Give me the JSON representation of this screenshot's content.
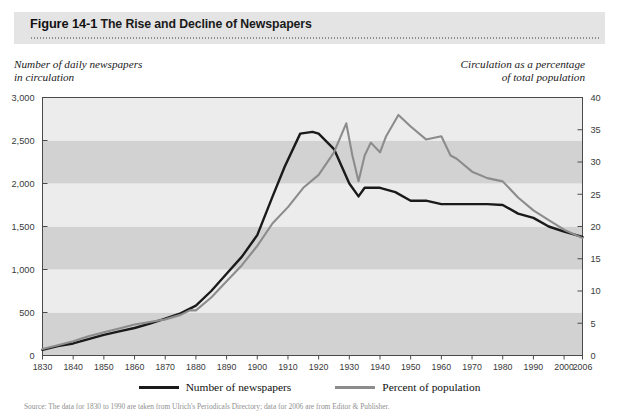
{
  "header": {
    "figure_number": "Figure 14-1",
    "figure_title": "The Rise and Decline of Newspapers"
  },
  "axis_captions": {
    "left_line1": "Number of daily newspapers",
    "left_line2": "in circulation",
    "right_line1": "Circulation as a percentage",
    "right_line2": "of total population"
  },
  "legend": {
    "series1_label": "Number of newspapers",
    "series2_label": "Percent of population",
    "series1_color": "#1a1a1a",
    "series2_color": "#8c8c8c"
  },
  "source_note": "Source: The data for 1830 to 1990 are taken from Ulrich's Periodicals Directory; data for 2006 are from Editor & Publisher.",
  "colors": {
    "header_band": "#e4e4e4",
    "band_light": "#ececed",
    "band_dark": "#d2d2d3",
    "plot_border": "#4a4a4a",
    "tick_text": "#3a3a3a"
  },
  "chart_data": {
    "type": "line",
    "title": "The Rise and Decline of Newspapers",
    "xlabel": "",
    "ylabel": "Number of daily newspapers in circulation",
    "y2label": "Circulation as a percentage of total population",
    "xlim": [
      1830,
      2006
    ],
    "ylim": [
      0,
      3000
    ],
    "y2lim": [
      0,
      40
    ],
    "grid": false,
    "banding": "alternating horizontal bands every 500 units",
    "legend_position": "bottom-center",
    "xticks": [
      "1830",
      "1840",
      "1850",
      "1860",
      "1870",
      "1880",
      "1890",
      "1900",
      "1910",
      "1920",
      "1930",
      "1940",
      "1950",
      "1960",
      "1970",
      "1980",
      "1990",
      "2000",
      "2006"
    ],
    "yticks": [
      "0",
      "500",
      "1,000",
      "1,500",
      "2,000",
      "2,500",
      "3,000"
    ],
    "y2ticks": [
      "0",
      "5",
      "10",
      "15",
      "20",
      "25",
      "30",
      "35",
      "40"
    ],
    "series": [
      {
        "name": "Number of newspapers",
        "axis": "left",
        "color": "#1a1a1a",
        "x": [
          1830,
          1835,
          1840,
          1845,
          1850,
          1855,
          1860,
          1865,
          1870,
          1875,
          1880,
          1885,
          1890,
          1895,
          1900,
          1905,
          1909,
          1914,
          1918,
          1920,
          1925,
          1930,
          1933,
          1935,
          1940,
          1945,
          1950,
          1955,
          1960,
          1965,
          1970,
          1975,
          1980,
          1985,
          1990,
          1995,
          2000,
          2006
        ],
        "values": [
          65,
          110,
          140,
          190,
          240,
          280,
          320,
          370,
          430,
          490,
          580,
          750,
          950,
          1150,
          1400,
          1850,
          2200,
          2580,
          2600,
          2580,
          2400,
          2000,
          1850,
          1950,
          1950,
          1900,
          1800,
          1800,
          1760,
          1760,
          1760,
          1760,
          1750,
          1650,
          1600,
          1500,
          1440,
          1380
        ]
      },
      {
        "name": "Percent of population",
        "axis": "right",
        "color": "#8c8c8c",
        "x": [
          1830,
          1835,
          1840,
          1845,
          1850,
          1855,
          1860,
          1865,
          1870,
          1875,
          1878,
          1880,
          1885,
          1890,
          1895,
          1900,
          1905,
          1910,
          1915,
          1920,
          1925,
          1929,
          1931,
          1933,
          1935,
          1937,
          1940,
          1942,
          1946,
          1950,
          1955,
          1960,
          1963,
          1965,
          1970,
          1975,
          1980,
          1985,
          1990,
          1995,
          2000,
          2006
        ],
        "values": [
          1.0,
          1.6,
          2.2,
          3.0,
          3.6,
          4.2,
          4.8,
          5.2,
          5.6,
          6.3,
          7.0,
          7.0,
          9.0,
          11.5,
          14.0,
          17.0,
          20.5,
          23.0,
          26.0,
          28.0,
          31.5,
          36.0,
          31.0,
          27.0,
          31.0,
          33.0,
          31.5,
          34.0,
          37.3,
          35.5,
          33.5,
          34.0,
          31.0,
          30.5,
          28.5,
          27.5,
          27.0,
          24.5,
          22.5,
          21.0,
          19.5,
          18.2
        ]
      }
    ]
  }
}
